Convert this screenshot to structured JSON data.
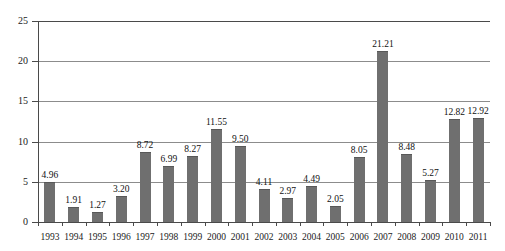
{
  "chart_data": {
    "type": "bar",
    "title": "",
    "subtitle": "",
    "xlabel": "",
    "ylabel": "",
    "ylim": [
      0,
      25
    ],
    "yticks": [
      0,
      5,
      10,
      15,
      20,
      25
    ],
    "ytick_labels": [
      "0",
      "5",
      "10",
      "15",
      "20",
      "25"
    ],
    "grid": true,
    "legend": false,
    "legend_position": "none",
    "bar_color": "#6f6f6f",
    "gridline_color": "#8c8c8c",
    "axis_color": "#4a4a4a",
    "data_labels_shown": true,
    "categories": [
      "1993",
      "1994",
      "1995",
      "1996",
      "1997",
      "1998",
      "1999",
      "2000",
      "2001",
      "2002",
      "2003",
      "2004",
      "2005",
      "2006",
      "2007",
      "2008",
      "2009",
      "2010",
      "2011"
    ],
    "values": [
      4.96,
      1.91,
      1.27,
      3.2,
      8.72,
      6.99,
      8.27,
      11.55,
      9.5,
      4.11,
      2.97,
      4.49,
      2.05,
      8.05,
      21.21,
      8.48,
      5.27,
      12.82,
      12.92
    ],
    "value_labels": [
      "4.96",
      "1.91",
      "1.27",
      "3.20",
      "8.72",
      "6.99",
      "8.27",
      "11.55",
      "9.50",
      "4.11",
      "2.97",
      "4.49",
      "2.05",
      "8.05",
      "21.21",
      "8.48",
      "5.27",
      "12.82",
      "12.92"
    ],
    "series": [
      {
        "name": "",
        "values": [
          4.96,
          1.91,
          1.27,
          3.2,
          8.72,
          6.99,
          8.27,
          11.55,
          9.5,
          4.11,
          2.97,
          4.49,
          2.05,
          8.05,
          21.21,
          8.48,
          5.27,
          12.82,
          12.92
        ]
      }
    ]
  }
}
